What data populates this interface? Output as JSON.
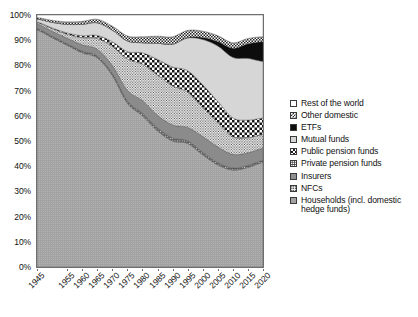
{
  "chart_data": {
    "type": "area",
    "title": "",
    "subtitle": "",
    "xlabel": "",
    "ylabel": "",
    "stacked": true,
    "normalized_percent": true,
    "grid": false,
    "legend_position": "right",
    "xlim": [
      1945,
      2020
    ],
    "ylim": [
      0,
      100
    ],
    "y_tick_labels": [
      "0%",
      "10%",
      "20%",
      "30%",
      "40%",
      "50%",
      "60%",
      "70%",
      "80%",
      "90%",
      "100%"
    ],
    "y_tick_values": [
      0,
      10,
      20,
      30,
      40,
      50,
      60,
      70,
      80,
      90,
      100
    ],
    "x_tick_labels": [
      "1945",
      "1955",
      "1960",
      "1965",
      "1970",
      "1975",
      "1980",
      "1985",
      "1990",
      "1995",
      "2000",
      "2005",
      "2010",
      "2015",
      "2020"
    ],
    "x_tick_values": [
      1945,
      1955,
      1960,
      1965,
      1970,
      1975,
      1980,
      1985,
      1990,
      1995,
      2000,
      2005,
      2010,
      2015,
      2020
    ],
    "x": [
      1945,
      1950,
      1955,
      1960,
      1965,
      1970,
      1975,
      1980,
      1985,
      1990,
      1995,
      2000,
      2005,
      2010,
      2015,
      2020
    ],
    "series": [
      {
        "name": "Households (incl. domestic hedge funds)",
        "pattern": "mid-gray-stipple",
        "color": "#a2a2a2",
        "values": [
          94.0,
          91.0,
          88.0,
          85.0,
          83.0,
          76.0,
          65.0,
          60.0,
          54.0,
          50.0,
          49.0,
          44.5,
          40.5,
          38.5,
          39.5,
          41.5
        ]
      },
      {
        "name": "NFCs",
        "pattern": "dark-gray-dots",
        "color": "#5e5e5e",
        "values": [
          0.6,
          0.6,
          0.6,
          0.7,
          0.7,
          0.8,
          0.9,
          1.0,
          1.2,
          1.2,
          1.1,
          1.0,
          0.9,
          0.8,
          0.8,
          0.8
        ]
      },
      {
        "name": "Insurers",
        "pattern": "dark-gray-solid",
        "color": "#8f8f8f",
        "values": [
          1.8,
          2.0,
          2.2,
          2.5,
          2.7,
          3.2,
          4.2,
          5.0,
          5.0,
          5.2,
          5.3,
          6.3,
          6.3,
          5.4,
          5.0,
          4.8
        ]
      },
      {
        "name": "Private pension funds",
        "pattern": "white-dotted",
        "color": "#ffffff",
        "values": [
          0.6,
          1.0,
          1.6,
          2.8,
          4.3,
          7.6,
          12.5,
          14.5,
          16.0,
          15.5,
          14.0,
          11.5,
          9.5,
          7.0,
          6.0,
          5.5
        ]
      },
      {
        "name": "Public pension funds",
        "pattern": "checkerboard-mid",
        "color": "#1f1f1f",
        "values": [
          0.2,
          0.3,
          0.5,
          0.8,
          1.2,
          1.8,
          2.9,
          4.5,
          6.2,
          7.5,
          8.5,
          9.0,
          8.5,
          7.5,
          7.0,
          6.5
        ]
      },
      {
        "name": "Mutual funds",
        "pattern": "light-gray-solid",
        "color": "#d5d5d5",
        "values": [
          1.2,
          2.2,
          3.4,
          4.5,
          5.0,
          4.6,
          4.2,
          4.0,
          6.4,
          9.0,
          13.0,
          18.0,
          22.0,
          24.0,
          24.5,
          22.5
        ]
      },
      {
        "name": "ETFs",
        "pattern": "black-solid",
        "color": "#0d0d0d",
        "values": [
          0.0,
          0.0,
          0.0,
          0.0,
          0.0,
          0.0,
          0.0,
          0.0,
          0.0,
          0.0,
          0.2,
          0.8,
          1.8,
          3.6,
          5.8,
          7.8
        ]
      },
      {
        "name": "Other domestic",
        "pattern": "checkerboard-small",
        "color": "#2b2b2b",
        "values": [
          0.6,
          0.8,
          1.0,
          1.2,
          1.4,
          1.6,
          2.0,
          2.4,
          2.8,
          3.0,
          2.8,
          2.5,
          2.3,
          2.2,
          2.1,
          2.0
        ]
      },
      {
        "name": "Rest of the world",
        "pattern": "white-solid",
        "color": "#ffffff",
        "values": [
          1.0,
          2.1,
          2.7,
          2.5,
          1.7,
          4.4,
          8.3,
          8.6,
          8.4,
          8.6,
          6.1,
          6.4,
          8.2,
          11.0,
          9.3,
          8.6
        ]
      }
    ]
  },
  "legend": {
    "items": [
      {
        "label": "Rest of the world",
        "swatch": "sw-white",
        "icon": "legend-swatch-rest-of-the-world"
      },
      {
        "label": "Other domestic",
        "swatch": "sw-check-sm",
        "icon": "legend-swatch-other-domestic"
      },
      {
        "label": "ETFs",
        "swatch": "sw-black",
        "icon": "legend-swatch-etfs"
      },
      {
        "label": "Mutual funds",
        "swatch": "sw-lightgray",
        "icon": "legend-swatch-mutual-funds"
      },
      {
        "label": "Public pension funds",
        "swatch": "sw-check-mid",
        "icon": "legend-swatch-public-pension-funds"
      },
      {
        "label": "Private pension funds",
        "swatch": "sw-dot-white",
        "icon": "legend-swatch-private-pension-funds"
      },
      {
        "label": "Insurers",
        "swatch": "sw-darkgray",
        "icon": "legend-swatch-insurers"
      },
      {
        "label": "NFCs",
        "swatch": "sw-dot-dark",
        "icon": "legend-swatch-nfcs"
      },
      {
        "label": "Households (incl. domestic",
        "label_cont": "hedge funds)",
        "swatch": "sw-midgray",
        "icon": "legend-swatch-households"
      }
    ]
  }
}
